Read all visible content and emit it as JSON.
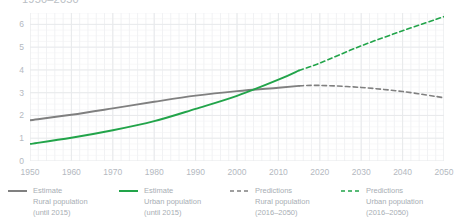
{
  "chart": {
    "title": "1950–2050"
  },
  "axes": {
    "y_ticks": [
      "0",
      "1",
      "2",
      "3",
      "4",
      "5",
      "6"
    ],
    "x_ticks": [
      "1950",
      "1960",
      "1970",
      "1980",
      "1990",
      "2000",
      "2010",
      "2020",
      "2030",
      "2040",
      "2050"
    ]
  },
  "legend": {
    "items": [
      {
        "name": "estimate-rural",
        "label": "Estimate\nRural population\n(until 2015)",
        "color": "#808080",
        "style": "solid"
      },
      {
        "name": "estimate-urban",
        "label": "Estimate\nUrban population\n(until 2015)",
        "color": "#22a44a",
        "style": "solid"
      },
      {
        "name": "predictions-rural",
        "label": "Predictions\nRural population\n(2016–2050)",
        "color": "#808080",
        "style": "dashed"
      },
      {
        "name": "predictions-urban",
        "label": "Predictions\nUrban population\n(2016–2050)",
        "color": "#22a44a",
        "style": "dashed"
      }
    ]
  },
  "chart_data": {
    "type": "line",
    "title": "1950–2050",
    "xlabel": "",
    "ylabel": "",
    "xlim": [
      1950,
      2050
    ],
    "ylim": [
      0,
      6.5
    ],
    "grid": true,
    "legend_position": "bottom",
    "colors": {
      "rural": "#808080",
      "urban": "#22a44a",
      "grid_major": "#e8eaec",
      "grid_minor": "#f1f2f4",
      "text": "#b4b9bf"
    },
    "series": [
      {
        "name": "Estimate Rural population (until 2015)",
        "style": "solid",
        "color": "#808080",
        "x": [
          1950,
          1960,
          1970,
          1980,
          1990,
          2000,
          2010,
          2015
        ],
        "values": [
          1.79,
          2.03,
          2.31,
          2.6,
          2.87,
          3.07,
          3.22,
          3.3
        ]
      },
      {
        "name": "Estimate Urban population (until 2015)",
        "style": "solid",
        "color": "#22a44a",
        "x": [
          1950,
          1960,
          1970,
          1980,
          1990,
          2000,
          2010,
          2015
        ],
        "values": [
          0.75,
          1.02,
          1.35,
          1.75,
          2.29,
          2.86,
          3.57,
          3.98
        ]
      },
      {
        "name": "Predictions Rural population (2016–2050)",
        "style": "dashed",
        "color": "#808080",
        "x": [
          2015,
          2020,
          2030,
          2040,
          2050
        ],
        "values": [
          3.3,
          3.32,
          3.23,
          3.05,
          2.78
        ]
      },
      {
        "name": "Predictions Urban population (2016–2050)",
        "style": "dashed",
        "color": "#22a44a",
        "x": [
          2015,
          2020,
          2030,
          2040,
          2050
        ],
        "values": [
          3.98,
          4.3,
          5.06,
          5.72,
          6.34
        ]
      }
    ],
    "annotations": [
      {
        "text": "Urban and rural population curves cross near 2007",
        "x": 2007,
        "y": 3.2
      }
    ]
  }
}
